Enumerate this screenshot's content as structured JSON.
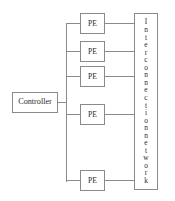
{
  "diagram": {
    "type": "block-diagram",
    "controller": {
      "label": "Controller",
      "x": 12,
      "y": 92,
      "width": 46,
      "height": 21
    },
    "bus": {
      "x": 66,
      "y_top": 23,
      "y_bottom": 182,
      "controller_stub_from": 58,
      "controller_stub_y": 102
    },
    "pe_label": "PE",
    "pes": [
      {
        "label": "PE",
        "x": 80,
        "y": 13,
        "width": 25,
        "height": 21,
        "center_y": 23
      },
      {
        "label": "PE",
        "x": 80,
        "y": 41,
        "width": 25,
        "height": 21,
        "center_y": 51
      },
      {
        "label": "PE",
        "x": 80,
        "y": 66,
        "width": 25,
        "height": 21,
        "center_y": 76
      },
      {
        "label": "PE",
        "x": 80,
        "y": 104,
        "width": 25,
        "height": 21,
        "center_y": 114
      },
      {
        "label": "PE",
        "x": 80,
        "y": 170,
        "width": 25,
        "height": 21,
        "center_y": 180
      }
    ],
    "interconnect": {
      "label": "Interconnection network",
      "glyphs": [
        "I",
        "n",
        "t",
        "e",
        "r",
        "c",
        "o",
        "n",
        "n",
        "e",
        "c",
        "t",
        "i",
        "o",
        "n",
        "n",
        "e",
        "t",
        "w",
        "o",
        "r",
        "k"
      ],
      "orientation": "vertical-stacked-letters",
      "x": 134,
      "y": 13,
      "width": 24,
      "height": 177
    },
    "colors": {
      "stroke": "#8a8a8a",
      "text": "#2b2b2b",
      "background": "#ffffff"
    }
  }
}
